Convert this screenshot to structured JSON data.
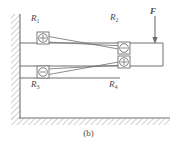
{
  "figure": {
    "caption": "(b)",
    "labels": {
      "r1": "R",
      "r1_sub": "1",
      "r2": "R",
      "r2_sub": "2",
      "r3": "R",
      "r3_sub": "3",
      "r4": "R",
      "r4_sub": "4",
      "force": "F"
    },
    "gauges": [
      {
        "id": "R1",
        "sign": "+",
        "x": 43,
        "y": 38
      },
      {
        "id": "R2",
        "sign": "-",
        "x": 124,
        "y": 48
      },
      {
        "id": "R3",
        "sign": "-",
        "x": 43,
        "y": 72
      },
      {
        "id": "R4",
        "sign": "+",
        "x": 124,
        "y": 62
      }
    ],
    "colors": {
      "line": "#6e6e6e",
      "hatch": "#9a9a9a",
      "text": "#4a4a4a",
      "background": "#ffffff"
    },
    "geometry": {
      "wall_x": 20,
      "wall_top": 14,
      "wall_bottom": 118,
      "beam_top_y": 43,
      "beam_mid_y": 66,
      "beam_right_x": 163,
      "beam_bottom_y": 66,
      "ground_y": 118,
      "force_arrow_x": 155,
      "force_arrow_top": 16,
      "force_arrow_bottom": 43
    }
  }
}
